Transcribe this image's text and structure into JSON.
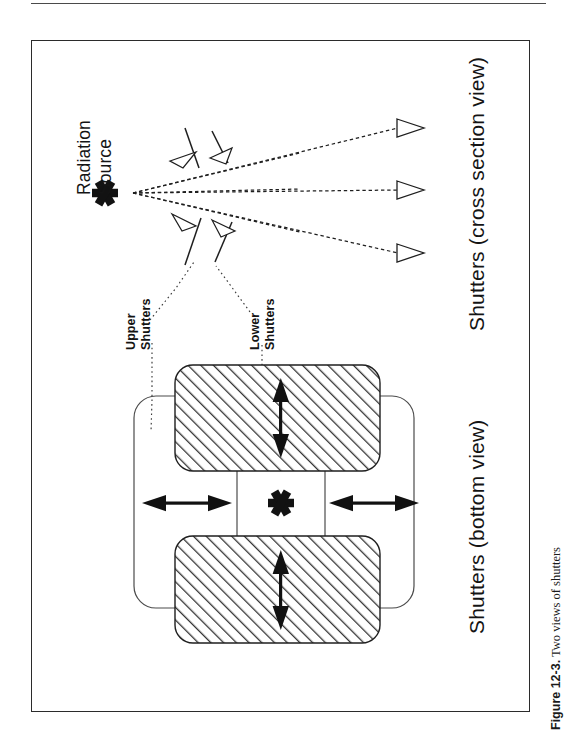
{
  "figure": {
    "caption_label": "Figure 12-3.",
    "caption_text": "Two views of shutters"
  },
  "labels": {
    "radiation_source_line1": "Radiation",
    "radiation_source_line2": "Source",
    "upper_shutters_line1": "Upper",
    "upper_shutters_line2": "Shutters",
    "lower_shutters_line1": "Lower",
    "lower_shutters_line2": "Shutters",
    "cross_section_view": "Shutters  (cross section view)",
    "bottom_view": "Shutters  (bottom view)"
  },
  "icons": {
    "radiation_source_marker": "asterisk-starburst",
    "beam_arrow": "open-triangle-arrowhead",
    "shutter_motion_arrow": "solid-double-arrow"
  },
  "colors": {
    "ink": "#1a1a1a",
    "frame": "#2b2b2b",
    "hatch": "#333333",
    "rule": "#4a4a4a",
    "paper": "#ffffff"
  },
  "diagram": {
    "cross_section": {
      "source_point": {
        "x": 133,
        "y": 193
      },
      "beam_count": 6,
      "beam_endpoints": [
        {
          "x": 404,
          "y": 126
        },
        {
          "x": 404,
          "y": 190
        },
        {
          "x": 404,
          "y": 255
        }
      ],
      "upper_blade_count": 2,
      "lower_blade_count": 2
    },
    "bottom_view": {
      "upper_shutter_plate_outline": "rounded-rect-horizontal",
      "lower_shutter_plates": 2,
      "horizontal_motion_arrows": 2,
      "vertical_motion_arrows": 2,
      "source_marker": "asterisk-starburst"
    }
  }
}
